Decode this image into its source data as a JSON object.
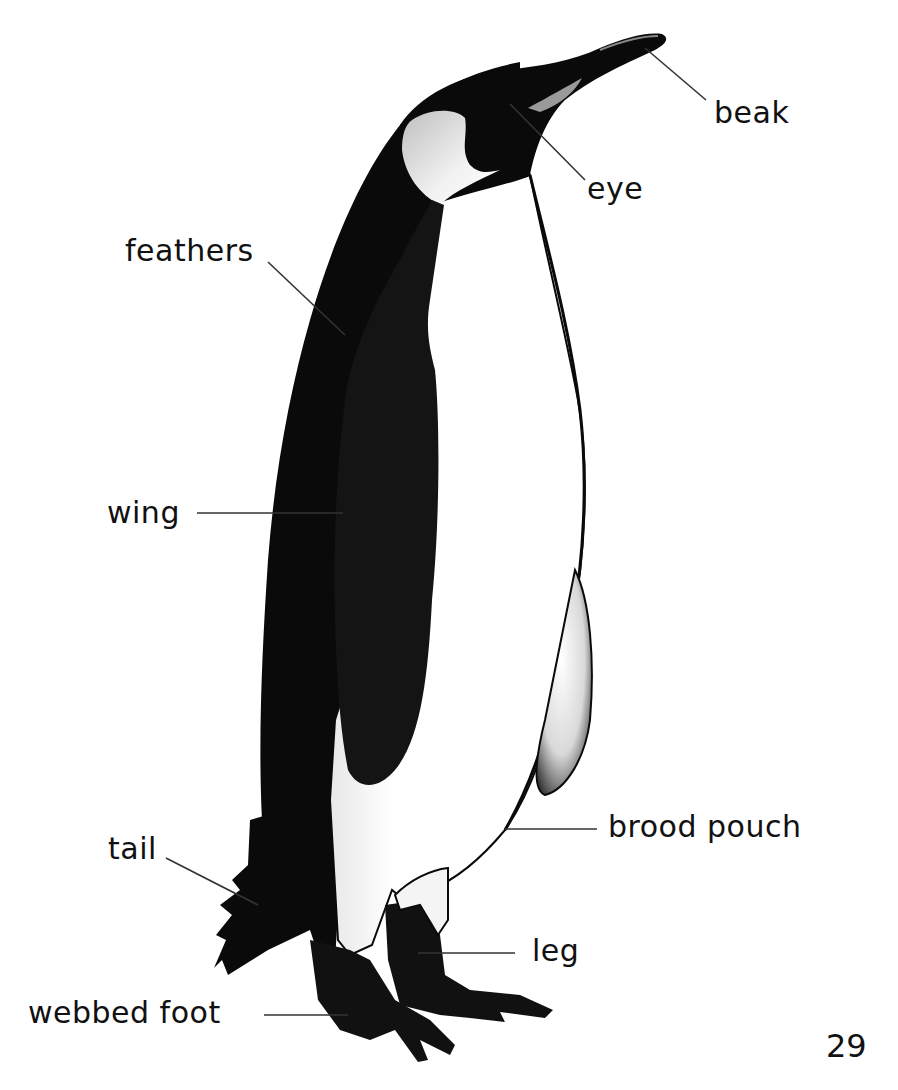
{
  "diagram": {
    "page_number": "29",
    "labels": [
      {
        "id": "beak",
        "text": "beak"
      },
      {
        "id": "eye",
        "text": "eye"
      },
      {
        "id": "feathers",
        "text": "feathers"
      },
      {
        "id": "wing",
        "text": "wing"
      },
      {
        "id": "brood-pouch",
        "text": "brood pouch"
      },
      {
        "id": "tail",
        "text": "tail"
      },
      {
        "id": "leg",
        "text": "leg"
      },
      {
        "id": "webbed-foot",
        "text": "webbed foot"
      }
    ],
    "colors": {
      "background": "#ffffff",
      "body_black": "#0a0a0a",
      "belly_white": "#ffffff",
      "ear_patch": "#dcdcdc",
      "leader_line": "#333333",
      "text": "#111111"
    }
  }
}
